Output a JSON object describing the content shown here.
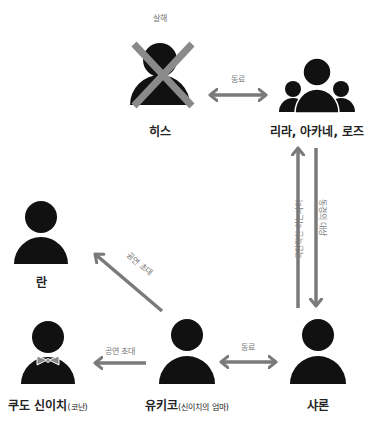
{
  "colors": {
    "figure": "#111111",
    "arrow": "#7a7a7a",
    "cross": "#8a8a8a",
    "label": "#222222",
    "edge_label": "#777777",
    "background": "#ffffff"
  },
  "nodes": {
    "heath": {
      "name": "히스",
      "status_label": "살해",
      "icon": "person-crossed-out-icon"
    },
    "group": {
      "name": "리라, 아카네, 로즈",
      "icon": "group-icon"
    },
    "ran": {
      "name": "란",
      "icon": "person-icon"
    },
    "shinichi": {
      "name": "쿠도 신이치",
      "note": "(코난)",
      "icon": "person-bowtie-icon"
    },
    "yukiko": {
      "name": "유키코",
      "note": "(신이치의 엄마)",
      "icon": "person-icon"
    },
    "sharon": {
      "name": "샤론",
      "icon": "person-icon"
    }
  },
  "edges": {
    "heath_group": {
      "label": "동료",
      "type": "bidirectional"
    },
    "sharon_group": {
      "label": "극단적인 아는사이",
      "type": "up"
    },
    "group_sharon": {
      "label": "동경의 대상",
      "type": "down"
    },
    "yukiko_ran": {
      "label": "공연 초대",
      "type": "directed"
    },
    "yukiko_shinichi": {
      "label": "공연 초대",
      "type": "directed"
    },
    "yukiko_sharon": {
      "label": "동료",
      "type": "bidirectional"
    }
  }
}
